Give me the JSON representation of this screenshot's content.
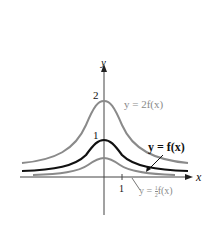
{
  "figure": {
    "axis_x_label": "x",
    "axis_y_label": "y",
    "tick_y_2": "2",
    "tick_y_1": "1",
    "tick_x_1": "1",
    "label_2f": "y = 2f(x)",
    "label_f": "y = f(x)",
    "label_half_f_prefix": "y = ",
    "label_half_f_num": "1",
    "label_half_f_den": "2",
    "label_half_f_suffix": "f(x)",
    "colors": {
      "gray_curve": "#8a8a8a",
      "main_curve": "#111111",
      "axes": "#333333"
    }
  }
}
